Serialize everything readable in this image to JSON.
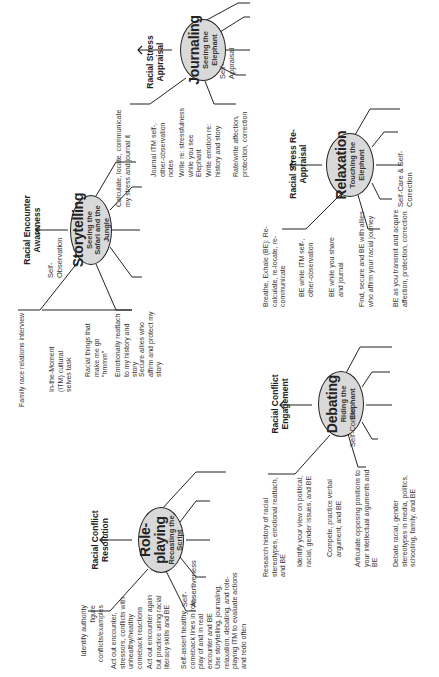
{
  "header": {
    "text": "Racial literacy skill-building processes and stages"
  },
  "stages": [
    {
      "id": "storytelling",
      "title": "Storytelling",
      "subtitle": "Seeing the Safari and the Jungle",
      "stage_label": "Racial Encounter Awareness",
      "outcome": "Self-Observation",
      "activities": [
        "Family race relations interview",
        "In-the-Moment (ITM) cultural selves task",
        "Racial things that make me go \"hmmm\"",
        "Emotionally reattach to my history and story",
        "Secure allies who affirm and protect my story"
      ]
    },
    {
      "id": "journaling",
      "title": "Journaling",
      "subtitle": "Seeing the Elephant",
      "stage_label": "Racial Stress Appraisal",
      "outcome": "Self-Appraisal",
      "activities": [
        "Calculate, locate, communicate my stress and journal it",
        "Journal ITM self-, other-observation notes",
        "Write re: stressfulness while you see Elephant",
        "Write emotion re: history and story",
        "Rate/write affection, protection, correction"
      ]
    },
    {
      "id": "role-playing",
      "title": "Role-playing",
      "subtitle": "Recasting the Script",
      "stage_label": "Racial Conflict Resolution",
      "outcome": "Self-Assertiveness",
      "activities": [
        "Identify authority figure conflicts/examples",
        "Act out encounter, stressors, conflicts with unhealthy/healthy comeback reactions",
        "Act out encounter again but practice using racial literacy skills and BE",
        "Self-assert healthy comeback lines in role-play of and in real encounter and BE",
        "Use storytelling, journaling, relaxation, debating, and role-playing ITM to evaluate actions and redo often"
      ]
    },
    {
      "id": "debating",
      "title": "Debating",
      "subtitle": "Riding the Elephant",
      "stage_label": "Racial Conflict Engagement",
      "outcome": "Self-Control",
      "activities": [
        "Research history of racial stereotypes, emotional reattach, and BE",
        "Identify your view on political, racial, gender issues, and BE",
        "Compete, practice verbal argument, and BE",
        "Articulate opposing positions to your intellectual arguments and BE",
        "Debate racial, gender stereotypes in media, politics, schooling, family, and BE"
      ]
    },
    {
      "id": "relaxation",
      "title": "Relaxation",
      "subtitle": "Touching the Elephant",
      "stage_label": "Racial Stress Re-Appraisal",
      "outcome": "Self-Care & Self-Correction",
      "activities": [
        "Breathe, Exhale (BE): Re-calculate, re-locate, re-communicate",
        "BE while ITM self-, other-observation",
        "BE while you share and journal",
        "Find, secure and BE with allies who affirm your racial journey",
        "BE as you transmit and acquire affection, protection, correction"
      ]
    }
  ]
}
